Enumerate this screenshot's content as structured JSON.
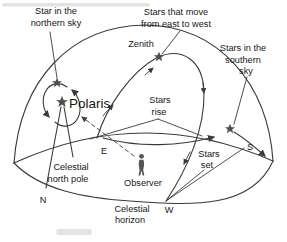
{
  "figure": {
    "type": "celestial-sphere-diagram",
    "colors": {
      "background": "#ffffff",
      "ink": "#3a3a3a",
      "star": "#4f4f4f",
      "text": "#161616"
    },
    "icons": {
      "star_icon": "★",
      "observer_icon": "person-silhouette",
      "arrowhead_icon": "➤"
    },
    "labels": {
      "star_north_1": "Star in the",
      "star_north_2": "northern sky",
      "stars_move_1": "Stars that move",
      "stars_move_2": "from east to west",
      "zenith": "Zenith",
      "southern_1": "Stars in the",
      "southern_2": "southern",
      "southern_3": "sky",
      "polaris": "Polaris",
      "stars_rise_1": "Stars",
      "stars_rise_2": "rise",
      "stars_set_1": "Stars",
      "stars_set_2": "set",
      "observer": "Observer",
      "pole_1": "Celestial",
      "pole_2": "north pole",
      "horizon_1": "Celestial",
      "horizon_2": "horizon",
      "dir_n": "N",
      "dir_e": "E",
      "dir_s": "S",
      "dir_w": "W"
    }
  }
}
